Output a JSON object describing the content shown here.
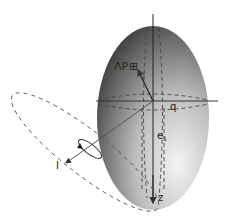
{
  "diagram": {
    "title": "",
    "labels": {
      "vector_p": "ΛP",
      "vector_p_box": "⊞",
      "q": "q",
      "e1": "e",
      "e1_sub": "1",
      "l_axis": "I",
      "z_axis": "z",
      "j_mark": "j"
    },
    "colors": {
      "ellipsoid_dark": "#4a4a4a",
      "ellipsoid_light": "#f2f2f2",
      "axis": "#333333",
      "dashed": "#555555"
    }
  }
}
